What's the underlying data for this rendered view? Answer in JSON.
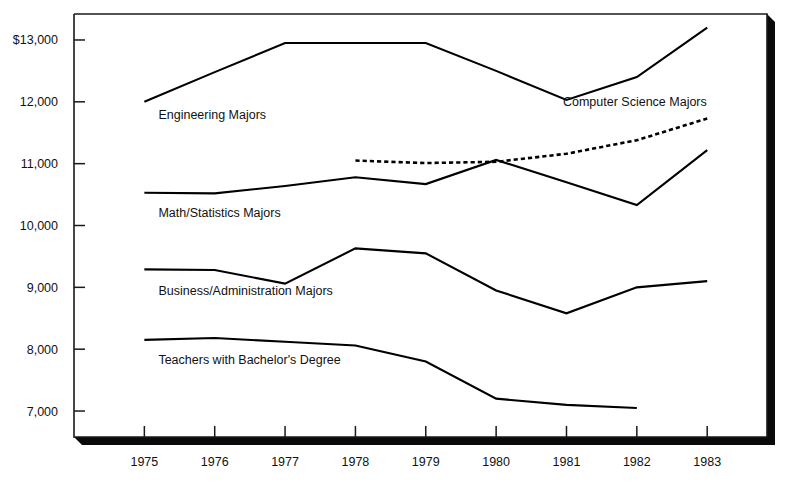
{
  "chart_data": {
    "type": "line",
    "title": "",
    "xlabel": "",
    "ylabel": "",
    "x": [
      1975,
      1976,
      1977,
      1978,
      1979,
      1980,
      1981,
      1982,
      1983
    ],
    "xtick_labels": [
      "1975",
      "1976",
      "1977",
      "1978",
      "1979",
      "1980",
      "1981",
      "1982",
      "1983"
    ],
    "ytick_labels": [
      "$13,000",
      "12,000",
      "11,000",
      "10,000",
      "9,000",
      "8,000",
      "7,000"
    ],
    "ytick_values": [
      13000,
      12000,
      11000,
      10000,
      9000,
      8000,
      7000
    ],
    "ylim": [
      6580,
      13420
    ],
    "xlim": [
      1974.0,
      1983.85
    ],
    "grid": false,
    "legend_position": "inline-labels",
    "series": [
      {
        "name": "Engineering Majors",
        "label": "Engineering Majors",
        "style": "solid",
        "color": "#000000",
        "x": [
          1975,
          1976,
          1977,
          1978,
          1979,
          1980,
          1981,
          1982,
          1983
        ],
        "values": [
          12000,
          12480,
          12950,
          12950,
          12950,
          12500,
          12030,
          12400,
          13200
        ],
        "label_x": 1975.2,
        "label_y": 11720
      },
      {
        "name": "Math/Statistics Majors",
        "label": "Math/Statistics Majors",
        "style": "solid",
        "color": "#000000",
        "x": [
          1975,
          1976,
          1977,
          1978,
          1979,
          1980,
          1981,
          1982,
          1983
        ],
        "values": [
          10530,
          10520,
          10640,
          10780,
          10670,
          11060,
          10700,
          10330,
          11220
        ],
        "label_x": 1975.2,
        "label_y": 10130
      },
      {
        "name": "Business/Administration Majors",
        "label": "Business/Administration Majors",
        "style": "solid",
        "color": "#000000",
        "x": [
          1975,
          1976,
          1977,
          1978,
          1979,
          1980,
          1981,
          1982,
          1983
        ],
        "values": [
          9290,
          9280,
          9060,
          9630,
          9550,
          8950,
          8580,
          9000,
          9100
        ],
        "label_x": 1975.2,
        "label_y": 8880
      },
      {
        "name": "Teachers with Bachelor's Degree",
        "label": "Teachers with Bachelor's Degree",
        "style": "solid",
        "color": "#000000",
        "x": [
          1975,
          1976,
          1977,
          1978,
          1979,
          1980,
          1981,
          1982
        ],
        "values": [
          8150,
          8180,
          8120,
          8060,
          7800,
          7200,
          7100,
          7050
        ],
        "label_x": 1975.2,
        "label_y": 7760
      },
      {
        "name": "Computer Science Majors",
        "label": "Computer Science Majors",
        "style": "dotted",
        "color": "#000000",
        "x": [
          1978,
          1979,
          1980,
          1981,
          1982,
          1983
        ],
        "values": [
          11050,
          11010,
          11030,
          11160,
          11380,
          11730
        ],
        "label_x": 1980.95,
        "label_y": 11930
      }
    ]
  },
  "axes": {
    "frame_color": "#1a1a1a",
    "shadow_color": "#0a0a0a"
  }
}
